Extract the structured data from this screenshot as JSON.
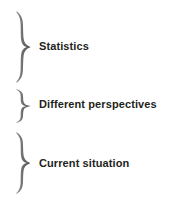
{
  "diagram": {
    "background_color": "#ffffff",
    "brace_color": "#6f6f6f",
    "brace_color_light": "#9a9a9a",
    "brace_color_dark": "#4d4d4d",
    "text_color": "#231f20",
    "width": 173,
    "height": 216,
    "items": [
      {
        "brace_icon": "curly-brace-right-icon",
        "label": "Statistics"
      },
      {
        "brace_icon": "curly-brace-right-icon",
        "label": "Different perspectives"
      },
      {
        "brace_icon": "curly-brace-right-icon",
        "label": "Current situation"
      }
    ]
  }
}
